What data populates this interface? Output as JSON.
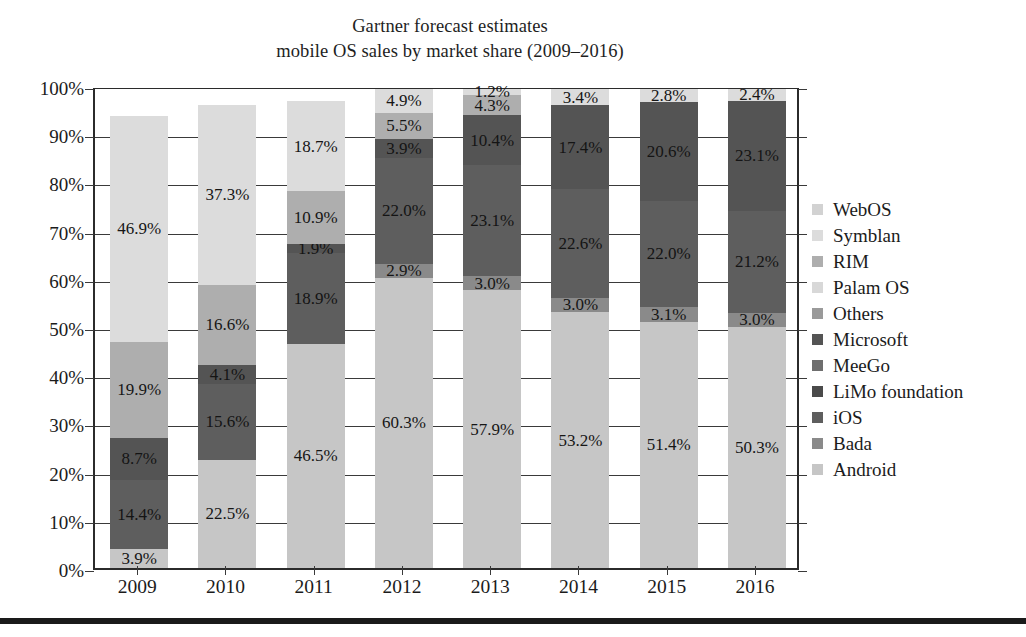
{
  "title": {
    "line1": "Gartner forecast estimates",
    "line2": "mobile OS sales by market share (2009–2016)"
  },
  "axes": {
    "y_ticks": [
      "100%",
      "90%",
      "80%",
      "70%",
      "60%",
      "50%",
      "40%",
      "30%",
      "20%",
      "10%",
      "0%"
    ],
    "x_ticks": [
      "2009",
      "2010",
      "2011",
      "2012",
      "2013",
      "2014",
      "2015",
      "2016"
    ]
  },
  "legend": {
    "items": [
      {
        "label": "WebOS",
        "color": "#d2d2d2"
      },
      {
        "label": "Symblan",
        "color": "#dcdcdc"
      },
      {
        "label": "RIM",
        "color": "#aeaeae"
      },
      {
        "label": "Palam OS",
        "color": "#d8d8d8"
      },
      {
        "label": "Others",
        "color": "#9a9a9a"
      },
      {
        "label": "Microsoft",
        "color": "#545454"
      },
      {
        "label": "MeeGo",
        "color": "#6e6e6e"
      },
      {
        "label": "LiMo foundation",
        "color": "#4a4a4a"
      },
      {
        "label": "iOS",
        "color": "#5e5e5e"
      },
      {
        "label": "Bada",
        "color": "#8a8a8a"
      },
      {
        "label": "Android",
        "color": "#c6c6c6"
      }
    ]
  },
  "chart_data": {
    "type": "bar",
    "stacked": true,
    "title": "Gartner forecast estimates mobile OS sales by market share (2009–2016)",
    "xlabel": "",
    "ylabel": "",
    "ylim": [
      0,
      100
    ],
    "ytick_step": 10,
    "grid": true,
    "legend_position": "right",
    "categories": [
      "2009",
      "2010",
      "2011",
      "2012",
      "2013",
      "2014",
      "2015",
      "2016"
    ],
    "series": [
      {
        "name": "Android",
        "color": "#c6c6c6",
        "values": [
          3.9,
          22.5,
          46.5,
          60.3,
          57.9,
          53.2,
          51.4,
          50.3
        ],
        "labels": [
          "3.9%",
          "22.5%",
          "46.5%",
          "60.3%",
          "57.9%",
          "53.2%",
          "51.4%",
          "50.3%"
        ]
      },
      {
        "name": "Bada",
        "color": "#8a8a8a",
        "values": [
          0,
          0,
          0,
          2.9,
          3.0,
          3.0,
          3.1,
          3.0
        ],
        "labels": [
          "",
          "",
          "",
          "2.9%",
          "3.0%",
          "3.0%",
          "3.1%",
          "3.0%"
        ]
      },
      {
        "name": "iOS",
        "color": "#5e5e5e",
        "values": [
          14.4,
          15.6,
          18.9,
          22.0,
          23.1,
          22.6,
          22.0,
          21.2
        ],
        "labels": [
          "14.4%",
          "15.6%",
          "18.9%",
          "22.0%",
          "23.1%",
          "22.6%",
          "22.0%",
          "21.2%"
        ]
      },
      {
        "name": "Microsoft",
        "color": "#545454",
        "values": [
          8.7,
          4.1,
          1.9,
          3.9,
          10.4,
          17.4,
          20.6,
          23.1
        ],
        "labels": [
          "8.7%",
          "4.1%",
          "1.9%",
          "3.9%",
          "10.4%",
          "17.4%",
          "20.6%",
          "23.1%"
        ]
      },
      {
        "name": "RIM",
        "color": "#aeaeae",
        "values": [
          19.9,
          16.6,
          10.9,
          5.5,
          4.3,
          0,
          0,
          0
        ],
        "labels": [
          "19.9%",
          "16.6%",
          "10.9%",
          "5.5%",
          "4.3%",
          "",
          "",
          ""
        ]
      },
      {
        "name": "Symblan",
        "color": "#dcdcdc",
        "values": [
          46.9,
          37.3,
          18.7,
          4.9,
          1.2,
          3.4,
          2.8,
          2.4
        ],
        "labels": [
          "46.9%",
          "37.3%",
          "18.7%",
          "4.9%",
          "1.2%",
          "3.4%",
          "2.8%",
          "2.4%"
        ]
      }
    ]
  }
}
